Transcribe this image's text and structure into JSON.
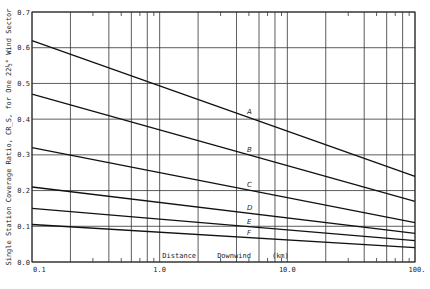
{
  "chart_data": {
    "type": "line",
    "title": "",
    "xlabel": "Distance     Downwind     (km)",
    "ylabel": "Single Station Coverage Ratio, CR_S, for One 22½° Wind Sector",
    "xscale": "log",
    "xlim": [
      0.1,
      100
    ],
    "ylim": [
      0.0,
      0.7
    ],
    "grid": true,
    "x_tick_labels": [
      "0.1",
      "1.0",
      "10.0",
      "100."
    ],
    "y_tick_labels": [
      "0.0",
      "0.1",
      "0.2",
      "0.3",
      "0.4",
      "0.5",
      "0.6",
      "0.7"
    ],
    "y_ticks": [
      0.0,
      0.1,
      0.2,
      0.3,
      0.4,
      0.5,
      0.6,
      0.7
    ],
    "x_major": [
      0.1,
      1,
      10,
      100
    ],
    "x_grid": [
      0.2,
      0.4,
      0.6,
      0.8,
      2,
      4,
      6,
      8,
      20,
      40,
      60,
      80
    ],
    "x_minor_ticks": [
      0.3,
      0.5,
      0.7,
      0.9,
      3,
      5,
      7,
      9,
      30,
      50,
      70,
      90
    ],
    "series": [
      {
        "name": "A",
        "x": [
          0.1,
          100
        ],
        "y": [
          0.62,
          0.24
        ]
      },
      {
        "name": "B",
        "x": [
          0.1,
          100
        ],
        "y": [
          0.47,
          0.17
        ]
      },
      {
        "name": "C",
        "x": [
          0.1,
          100
        ],
        "y": [
          0.32,
          0.11
        ]
      },
      {
        "name": "D",
        "x": [
          0.1,
          100
        ],
        "y": [
          0.21,
          0.08
        ]
      },
      {
        "name": "E",
        "x": [
          0.1,
          100
        ],
        "y": [
          0.15,
          0.06
        ]
      },
      {
        "name": "F",
        "x": [
          0.1,
          100
        ],
        "y": [
          0.105,
          0.04
        ]
      }
    ],
    "curve_label_x": 5.0
  }
}
